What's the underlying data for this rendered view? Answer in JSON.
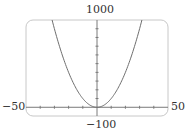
{
  "chart_data": {
    "type": "line",
    "title": "",
    "xlabel": "",
    "ylabel": "",
    "function": "y = x^2",
    "xlim": [
      -50,
      50
    ],
    "ylim": [
      -100,
      1000
    ],
    "x_tick_step": 10,
    "y_tick_step": 100,
    "grid": false,
    "legend": null,
    "window_labels": {
      "ymax": "1000",
      "ymin": "−100",
      "xmin": "−50",
      "xmax": "50"
    },
    "series": [
      {
        "name": "y = x^2",
        "x": [
          -31.6,
          -30,
          -25,
          -20,
          -15,
          -10,
          -5,
          0,
          5,
          10,
          15,
          20,
          25,
          30,
          31.6
        ],
        "values": [
          1000,
          900,
          625,
          400,
          225,
          100,
          25,
          0,
          25,
          100,
          225,
          400,
          625,
          900,
          1000
        ]
      }
    ]
  },
  "colors": {
    "frame": "#c8c8c8",
    "axes": "#7a7a7a",
    "curve": "#6e6e6e",
    "text": "#333333"
  }
}
